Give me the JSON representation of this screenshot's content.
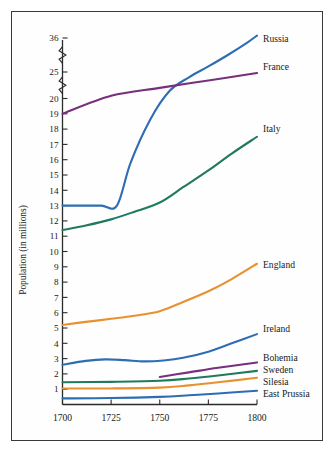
{
  "chart_data": {
    "type": "line",
    "title": "",
    "xlabel": "",
    "ylabel": "Population (in millions)",
    "xlim": [
      1700,
      1800
    ],
    "ylim": [
      0,
      37
    ],
    "grid": false,
    "legend_position": "right-inline",
    "x_ticks": [
      "1700",
      "1725",
      "1750",
      "1775",
      "1800"
    ],
    "x_tick_values": [
      1700,
      1725,
      1750,
      1775,
      1800
    ],
    "y_ticks": [
      "1",
      "2",
      "3",
      "4",
      "5",
      "6",
      "7",
      "8",
      "9",
      "10",
      "11",
      "12",
      "13",
      "14",
      "15",
      "16",
      "17",
      "18",
      "19",
      "20",
      "25",
      "36"
    ],
    "y_tick_values": [
      1,
      2,
      3,
      4,
      5,
      6,
      7,
      8,
      9,
      10,
      11,
      12,
      13,
      14,
      15,
      16,
      17,
      18,
      19,
      20,
      25,
      36
    ],
    "axis_breaks": [
      {
        "between": [
          20,
          25
        ]
      },
      {
        "between": [
          25,
          36
        ]
      }
    ],
    "series": [
      {
        "name": "Russia",
        "color": "#2e6db4",
        "x": [
          1700,
          1710,
          1720,
          1728,
          1735,
          1745,
          1755,
          1765,
          1775,
          1785,
          1795,
          1800
        ],
        "values": [
          13.0,
          13.0,
          13.0,
          13.0,
          15.8,
          18.6,
          21.4,
          24.0,
          26.8,
          30.5,
          34.5,
          36.8
        ]
      },
      {
        "name": "France",
        "color": "#77307e",
        "x": [
          1700,
          1725,
          1750,
          1775,
          1800
        ],
        "values": [
          19.0,
          20.5,
          22.0,
          23.4,
          24.8
        ]
      },
      {
        "name": "Italy",
        "color": "#1f7a5f",
        "x": [
          1700,
          1712,
          1725,
          1737,
          1750,
          1762,
          1775,
          1787,
          1800
        ],
        "values": [
          11.4,
          11.7,
          12.1,
          12.6,
          13.2,
          14.2,
          15.3,
          16.4,
          17.5
        ]
      },
      {
        "name": "England",
        "color": "#e8912e",
        "x": [
          1700,
          1712,
          1725,
          1737,
          1750,
          1762,
          1775,
          1787,
          1800
        ],
        "values": [
          5.2,
          5.4,
          5.6,
          5.8,
          6.1,
          6.7,
          7.4,
          8.2,
          9.2
        ]
      },
      {
        "name": "Ireland",
        "color": "#2e6db4",
        "x": [
          1700,
          1712,
          1722,
          1732,
          1742,
          1752,
          1762,
          1775,
          1787,
          1800
        ],
        "values": [
          2.6,
          2.85,
          2.95,
          2.9,
          2.82,
          2.88,
          3.05,
          3.45,
          4.0,
          4.6
        ]
      },
      {
        "name": "Bohemia",
        "color": "#77307e",
        "x": [
          1750,
          1765,
          1780,
          1800
        ],
        "values": [
          1.8,
          2.1,
          2.4,
          2.75
        ]
      },
      {
        "name": "Sweden",
        "color": "#1f7a5f",
        "x": [
          1700,
          1725,
          1750,
          1765,
          1780,
          1800
        ],
        "values": [
          1.45,
          1.48,
          1.55,
          1.7,
          1.9,
          2.2
        ]
      },
      {
        "name": "Silesia",
        "color": "#e8912e",
        "x": [
          1700,
          1725,
          1750,
          1765,
          1780,
          1800
        ],
        "values": [
          1.05,
          1.05,
          1.1,
          1.25,
          1.45,
          1.75
        ]
      },
      {
        "name": "East Prussia",
        "color": "#2e6db4",
        "x": [
          1700,
          1725,
          1750,
          1765,
          1780,
          1800
        ],
        "values": [
          0.4,
          0.42,
          0.5,
          0.6,
          0.72,
          0.9
        ]
      }
    ],
    "series_labels": [
      {
        "name": "Russia",
        "y_px": 42
      },
      {
        "name": "France",
        "y_px": 70
      },
      {
        "name": "Italy",
        "y_px": 132
      },
      {
        "name": "England",
        "y_px": 268
      },
      {
        "name": "Ireland",
        "y_px": 332
      },
      {
        "name": "Bohemia",
        "y_px": 361
      },
      {
        "name": "Sweden",
        "y_px": 373
      },
      {
        "name": "Silesia",
        "y_px": 385
      },
      {
        "name": "East Prussia",
        "y_px": 397
      }
    ]
  }
}
